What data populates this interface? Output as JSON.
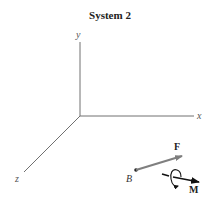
{
  "title": "System 2",
  "axes": {
    "x_label": "x",
    "y_label": "y",
    "z_label": "z"
  },
  "point": {
    "label": "B"
  },
  "force": {
    "label": "F",
    "color": "#7f7f7f"
  },
  "moment": {
    "label": "M",
    "color": "#111111"
  },
  "colors": {
    "axis": "#707070",
    "text": "#222222"
  }
}
